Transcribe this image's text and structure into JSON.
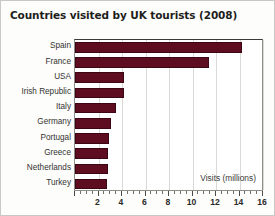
{
  "chart_data": {
    "type": "bar",
    "orientation": "horizontal",
    "title": "Countries visited by UK tourists (2008)",
    "xlabel": "Visits (millions)",
    "ylabel": "",
    "categories": [
      "Spain",
      "France",
      "USA",
      "Irish Republic",
      "Italy",
      "Germany",
      "Portugal",
      "Greece",
      "Netherlands",
      "Turkey"
    ],
    "values": [
      14.2,
      11.4,
      4.2,
      4.2,
      3.5,
      3.1,
      2.9,
      2.8,
      2.8,
      2.7
    ],
    "xlim": [
      0,
      16
    ],
    "xticks": [
      0,
      2,
      4,
      6,
      8,
      10,
      12,
      14,
      16
    ],
    "xtick_labels": [
      "",
      "2",
      "4",
      "6",
      "8",
      "10",
      "12",
      "14",
      "16"
    ],
    "minor_tick_step": 0.5,
    "grid": "vertical",
    "legend": "none",
    "bar_color": "#5e0d20",
    "gridline_color": "#d9d9d6",
    "background_color": "#ffffff"
  }
}
